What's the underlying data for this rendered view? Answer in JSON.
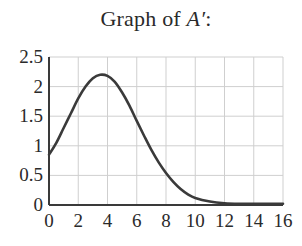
{
  "title": {
    "prefix": "Graph of ",
    "variable": "A′",
    "suffix": ":"
  },
  "chart_data": {
    "type": "line",
    "title": "Graph of A′:",
    "xlabel": "",
    "ylabel": "",
    "xlim": [
      0,
      16
    ],
    "ylim": [
      0,
      2.5
    ],
    "grid": true,
    "x_ticks": [
      0,
      2,
      4,
      6,
      8,
      10,
      12,
      14,
      16
    ],
    "y_ticks": [
      0,
      0.5,
      1,
      1.5,
      2,
      2.5
    ],
    "x_tick_labels": [
      "0",
      "2",
      "4",
      "6",
      "8",
      "10",
      "12",
      "14",
      "16"
    ],
    "y_tick_labels": [
      "0",
      "0.5",
      "1",
      "1.5",
      "2",
      "2.5"
    ],
    "series": [
      {
        "name": "A′",
        "color": "#3a3a3a",
        "x": [
          0,
          0.5,
          1,
          1.5,
          2,
          2.5,
          3,
          3.5,
          4,
          4.5,
          5,
          5.5,
          6,
          6.5,
          7,
          7.5,
          8,
          8.5,
          9,
          9.5,
          10,
          11,
          12,
          13,
          14,
          15,
          16
        ],
        "y": [
          0.85,
          1.05,
          1.3,
          1.55,
          1.8,
          2.0,
          2.14,
          2.2,
          2.18,
          2.08,
          1.9,
          1.68,
          1.42,
          1.17,
          0.93,
          0.72,
          0.54,
          0.39,
          0.27,
          0.18,
          0.12,
          0.06,
          0.03,
          0.02,
          0.02,
          0.02,
          0.02
        ]
      }
    ],
    "colors": {
      "axis": "#3a3a3a",
      "grid": "#cfcfcf",
      "curve": "#3a3a3a"
    }
  }
}
